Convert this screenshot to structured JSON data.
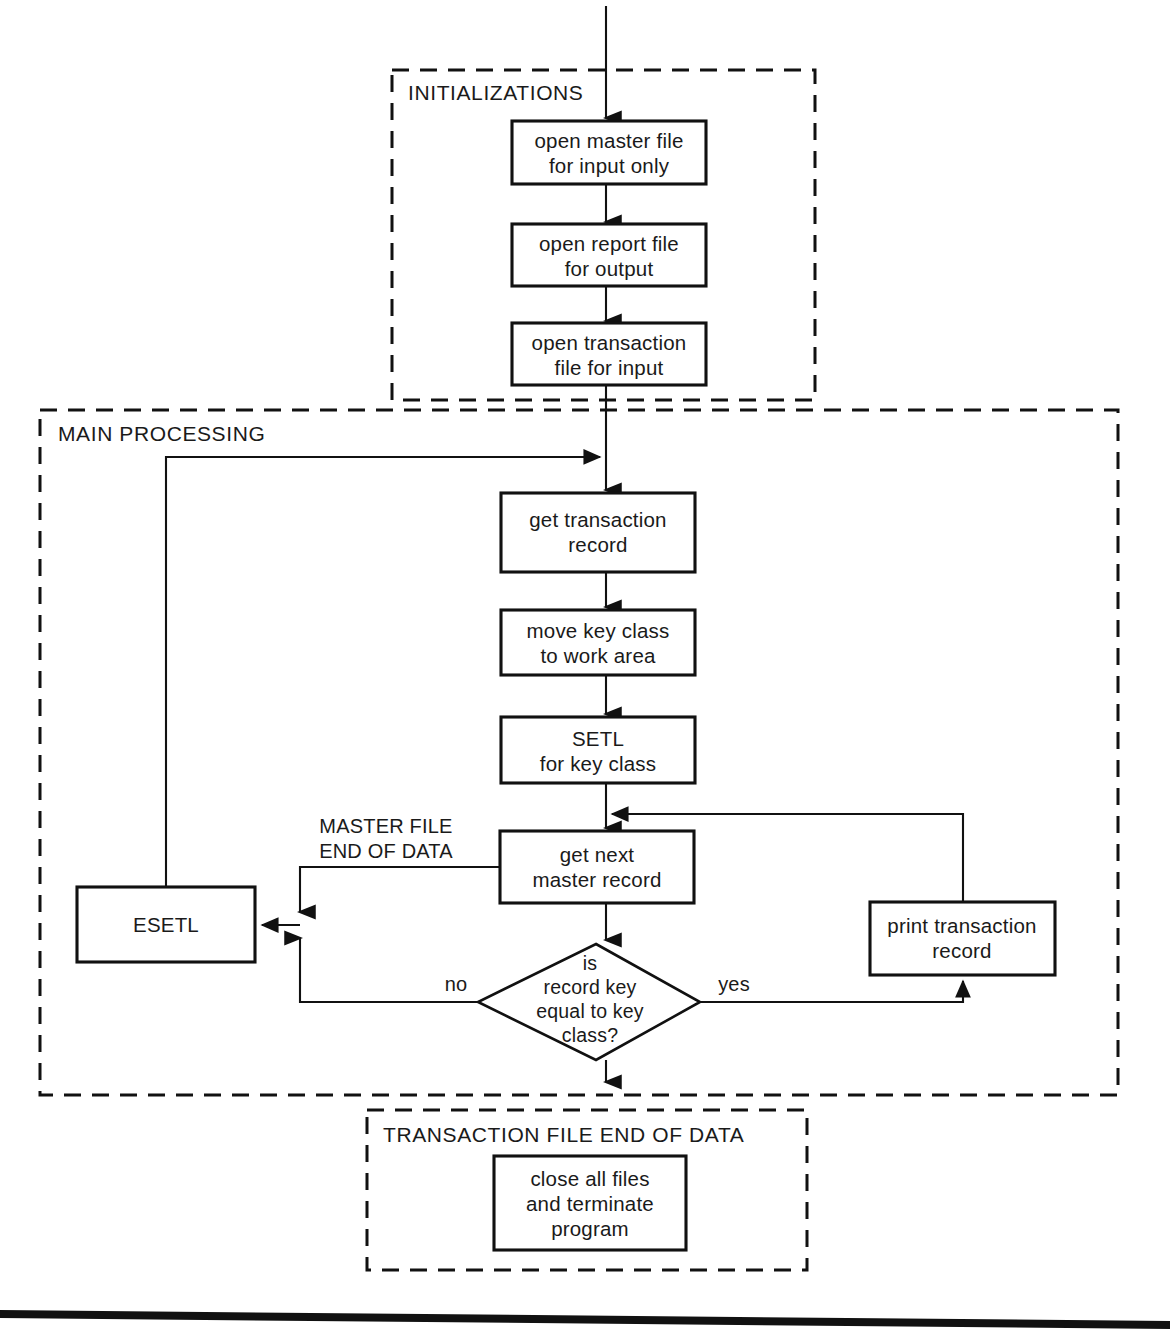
{
  "diagram": {
    "groups": [
      {
        "id": "initializations",
        "label": "INITIALIZATIONS"
      },
      {
        "id": "main_processing",
        "label": "MAIN PROCESSING"
      },
      {
        "id": "transaction_eod",
        "label": "TRANSACTION FILE END OF DATA"
      }
    ],
    "nodes": [
      {
        "id": "open_master",
        "type": "process",
        "line1": "open master file",
        "line2": "for input only"
      },
      {
        "id": "open_report",
        "type": "process",
        "line1": "open report file",
        "line2": "for output"
      },
      {
        "id": "open_transaction",
        "type": "process",
        "line1": "open transaction",
        "line2": "file for input"
      },
      {
        "id": "get_transaction",
        "type": "process",
        "line1": "get transaction",
        "line2": "record"
      },
      {
        "id": "move_key_class",
        "type": "process",
        "line1": "move key class",
        "line2": "to work area"
      },
      {
        "id": "setl",
        "type": "process",
        "line1": "SETL",
        "line2": "for key class"
      },
      {
        "id": "get_next_master",
        "type": "process",
        "line1": "get next",
        "line2": "master record"
      },
      {
        "id": "esetl",
        "type": "process",
        "line1": "ESETL",
        "line2": ""
      },
      {
        "id": "print_transaction",
        "type": "process",
        "line1": "print transaction",
        "line2": "record"
      },
      {
        "id": "close_all",
        "type": "process",
        "line1": "close all files",
        "line2": "and terminate",
        "line3": "program"
      },
      {
        "id": "key_compare",
        "type": "decision",
        "line1": "is",
        "line2": "record key",
        "line3": "equal to key",
        "line4": "class?"
      }
    ],
    "edge_labels": {
      "no": "no",
      "yes": "yes",
      "master_eod_line1": "MASTER FILE",
      "master_eod_line2": "END OF DATA"
    },
    "colors": {
      "ink": "#111111",
      "paper": "#ffffff"
    }
  }
}
